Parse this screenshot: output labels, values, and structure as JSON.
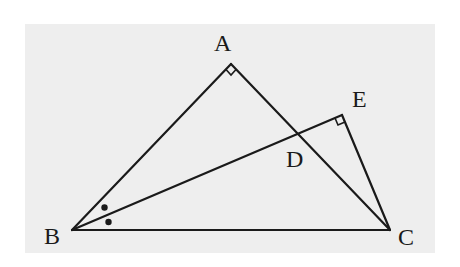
{
  "diagram": {
    "type": "geometry",
    "background_color": "#eeeeee",
    "line_color": "#1a1a1a",
    "points": {
      "A": {
        "label": "A",
        "x": 231,
        "y": 64
      },
      "B": {
        "label": "B",
        "x": 72,
        "y": 230
      },
      "C": {
        "label": "C",
        "x": 390,
        "y": 230
      },
      "D": {
        "label": "D",
        "x": 297,
        "y": 134
      },
      "E": {
        "label": "E",
        "x": 342,
        "y": 115
      }
    },
    "segments": [
      "AB",
      "AC",
      "BC",
      "BE",
      "EC"
    ],
    "right_angles": [
      "A",
      "E"
    ],
    "equal_angle_marks": {
      "vertex": "B",
      "marks": 2,
      "style": "dot"
    },
    "labels": {
      "A": "A",
      "B": "B",
      "C": "C",
      "D": "D",
      "E": "E"
    }
  }
}
